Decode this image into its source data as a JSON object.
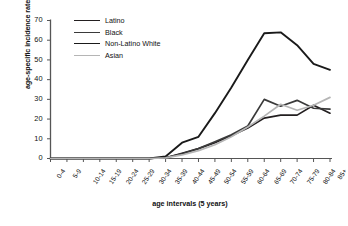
{
  "chart_data": {
    "type": "line",
    "title": "",
    "xlabel": "age intervals (5 years)",
    "ylabel": "age-specific incidence rate",
    "categories": [
      "0-4",
      "5-9",
      "10-14",
      "15-19",
      "20-24",
      "25-29",
      "30-34",
      "35-39",
      "40-44",
      "45-49",
      "50-54",
      "55-59",
      "60-64",
      "65-69",
      "70-74",
      "75-79",
      "80-84",
      "85+"
    ],
    "ylim": [
      0,
      70
    ],
    "yticks": [
      0,
      10,
      20,
      30,
      40,
      50,
      60,
      70
    ],
    "grid": false,
    "legend_position": "top-left",
    "series": [
      {
        "name": "Latino",
        "color": "#231f20",
        "width": 1.7,
        "values": [
          0,
          0,
          0,
          0,
          0,
          0,
          0,
          0.4,
          2.6,
          5.0,
          8.0,
          11.5,
          15.5,
          20.5,
          22.0,
          22.0,
          27.0,
          23.0
        ]
      },
      {
        "name": "Black",
        "color": "#3a3a3a",
        "width": 1.7,
        "values": [
          0,
          0,
          0,
          0,
          0,
          0,
          0,
          0.4,
          2.4,
          5.0,
          8.5,
          12.0,
          16.5,
          30.0,
          26.5,
          29.5,
          25.5,
          25.0
        ]
      },
      {
        "name": "Non-Latino White",
        "color": "#1a1a1a",
        "width": 1.9,
        "values": [
          0,
          0,
          0,
          0,
          0,
          0,
          0,
          1.0,
          8.0,
          11.0,
          23.0,
          36.0,
          50.0,
          63.5,
          64.0,
          57.5,
          48.0,
          45.0
        ]
      },
      {
        "name": "Asian",
        "color": "#b5b5b5",
        "width": 1.7,
        "values": [
          0,
          0,
          0,
          0,
          0,
          0,
          0,
          0.3,
          1.8,
          4.0,
          7.0,
          11.0,
          16.0,
          21.5,
          27.5,
          24.5,
          27.0,
          31.0
        ]
      }
    ]
  },
  "legend": {
    "items": [
      {
        "label": "Latino"
      },
      {
        "label": "Black"
      },
      {
        "label": "Non-Latino White"
      },
      {
        "label": "Asian"
      }
    ]
  },
  "axes": {
    "y_title": "age-specific incidence rate",
    "x_title": "age intervals (5 years)"
  }
}
